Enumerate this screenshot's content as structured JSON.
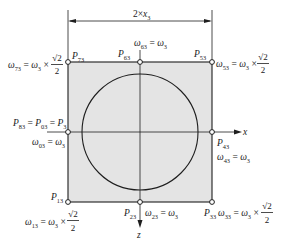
{
  "figure": {
    "colors": {
      "shaded_region": "#e4e4e4",
      "circle_fill": "#ffffff",
      "line": "#1e1e1e"
    },
    "dimension": {
      "prefix": "2×",
      "var": "x",
      "sub": "3"
    },
    "axes": {
      "x": "x",
      "z": "z"
    },
    "points": {
      "p73": {
        "sym": "P",
        "sub": "73"
      },
      "p63": {
        "sym": "P",
        "sub": "63"
      },
      "p53": {
        "sym": "P",
        "sub": "53"
      },
      "p43": {
        "sym": "P",
        "sub": "43"
      },
      "p33": {
        "sym": "P",
        "sub": "33"
      },
      "p23": {
        "sym": "P",
        "sub": "23"
      },
      "p13": {
        "sym": "P",
        "sub": "13"
      },
      "p83": {
        "sym": "P",
        "sub": "83",
        "eq1": " = ",
        "sym2": "P",
        "sub2": "03",
        "eq2": " = ",
        "sym3": "P",
        "sub3": "3"
      }
    },
    "omegas": {
      "w73": {
        "sym": "ω",
        "sub": "73",
        "eq": " = ",
        "sym2": "ω",
        "sub2": "3",
        "times": " ×",
        "num": "√2",
        "den": "2"
      },
      "w63": {
        "sym": "ω",
        "sub": "63",
        "eq": " = ",
        "sym2": "ω",
        "sub2": "3"
      },
      "w53": {
        "sym": "ω",
        "sub": "53",
        "eq": " = ",
        "sym2": "ω",
        "sub2": "3",
        "times": " ×",
        "num": "√2",
        "den": "2"
      },
      "w43": {
        "sym": "ω",
        "sub": "43",
        "eq": " = ",
        "sym2": "ω",
        "sub2": "3"
      },
      "w33": {
        "sym": "ω",
        "sub": "33",
        "eq": " = ",
        "sym2": "ω",
        "sub2": "3",
        "times": " ×",
        "num": "√2",
        "den": "2"
      },
      "w23": {
        "sym": "ω",
        "sub": "23",
        "eq": " = ",
        "sym2": "ω",
        "sub2": "3"
      },
      "w13": {
        "sym": "ω",
        "sub": "13",
        "eq": " = ",
        "sym2": "ω",
        "sub2": "3",
        "times": " ×",
        "num": "√2",
        "den": "2"
      },
      "w03": {
        "sym": "ω",
        "sub": "03",
        "eq": " = ",
        "sym2": "ω",
        "sub2": "3"
      }
    }
  }
}
